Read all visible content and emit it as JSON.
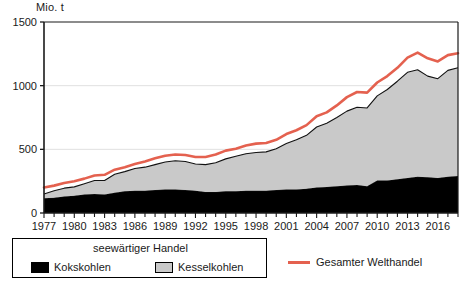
{
  "chart_data": {
    "type": "area",
    "title": "",
    "subtitle": "",
    "xlabel": "",
    "ylabel": "Mio. t",
    "unit_label": "Mio. t",
    "stacked": true,
    "grid": true,
    "legend_position": "bottom",
    "xlim": [
      1977,
      2018
    ],
    "ylim": [
      0,
      1500
    ],
    "yticks": [
      0,
      500,
      1000,
      1500
    ],
    "ytick_labels": [
      "0",
      "500",
      "1000",
      "1500"
    ],
    "xticks": [
      1977,
      1980,
      1983,
      1986,
      1989,
      1992,
      1995,
      1998,
      2001,
      2004,
      2007,
      2010,
      2013,
      2016
    ],
    "xtick_labels": [
      "1977",
      "1980",
      "1983",
      "1986",
      "1989",
      "1992",
      "1995",
      "1998",
      "2001",
      "2004",
      "2007",
      "2010",
      "2013",
      "2016"
    ],
    "x": [
      1977,
      1978,
      1979,
      1980,
      1981,
      1982,
      1983,
      1984,
      1985,
      1986,
      1987,
      1988,
      1989,
      1990,
      1991,
      1992,
      1993,
      1994,
      1995,
      1996,
      1997,
      1998,
      1999,
      2000,
      2001,
      2002,
      2003,
      2004,
      2005,
      2006,
      2007,
      2008,
      2009,
      2010,
      2011,
      2012,
      2013,
      2014,
      2015,
      2016,
      2017,
      2018
    ],
    "series": [
      {
        "name": "Kokskohlen",
        "color": "#000000",
        "values": [
          115,
          120,
          130,
          135,
          145,
          150,
          145,
          160,
          170,
          175,
          175,
          180,
          185,
          185,
          180,
          175,
          165,
          165,
          170,
          170,
          175,
          175,
          175,
          180,
          185,
          185,
          190,
          200,
          205,
          210,
          215,
          220,
          210,
          255,
          255,
          265,
          275,
          285,
          280,
          275,
          285,
          290
        ]
      },
      {
        "name": "Kesselkohlen",
        "color": "#c9c9c9",
        "values": [
          35,
          55,
          65,
          70,
          85,
          105,
          110,
          145,
          155,
          175,
          185,
          200,
          215,
          225,
          225,
          210,
          215,
          230,
          255,
          275,
          290,
          300,
          305,
          325,
          360,
          390,
          420,
          475,
          500,
          540,
          585,
          610,
          615,
          665,
          715,
          770,
          830,
          840,
          795,
          780,
          835,
          850
        ]
      }
    ],
    "line_series": [
      {
        "name": "Gesamter Welthandel",
        "color": "#e4614f",
        "values": [
          200,
          215,
          235,
          250,
          270,
          295,
          300,
          340,
          360,
          385,
          405,
          430,
          450,
          460,
          455,
          440,
          440,
          460,
          490,
          505,
          530,
          545,
          550,
          575,
          620,
          650,
          690,
          760,
          790,
          845,
          910,
          950,
          945,
          1025,
          1075,
          1140,
          1220,
          1260,
          1215,
          1190,
          1240,
          1255
        ]
      }
    ]
  },
  "legend": {
    "group_title": "seewärtiger Handel",
    "items": [
      {
        "label": "Kokskohlen",
        "swatch": "black-square-swatch"
      },
      {
        "label": "Kesselkohlen",
        "swatch": "gray-square-swatch"
      }
    ],
    "line_items": [
      {
        "label": "Gesamter Welthandel",
        "swatch": "red-line-swatch"
      }
    ]
  },
  "colors": {
    "kokskohlen": "#000000",
    "kesselkohlen": "#c9c9c9",
    "welthandel_line": "#e4614f",
    "axis": "#1a1a1a",
    "grid": "#e0e0e0",
    "background": "#ffffff"
  }
}
